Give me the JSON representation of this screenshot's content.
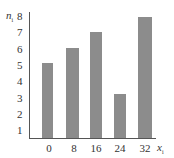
{
  "chart_data": {
    "type": "bar",
    "title": "",
    "xlabel": "x_i",
    "ylabel": "n_i",
    "xlabel_main": "x",
    "xlabel_sub": "i",
    "ylabel_main": "n",
    "ylabel_sub": "i",
    "categories": [
      "0",
      "8",
      "16",
      "24",
      "32"
    ],
    "values": [
      5.2,
      6.1,
      7.1,
      3.3,
      8.0
    ],
    "yticks": [
      "1",
      "2",
      "3",
      "4",
      "5",
      "6",
      "7",
      "8"
    ],
    "ylim": [
      0,
      8
    ],
    "grid": false,
    "legend": null,
    "bar_color": "#8c8c8c",
    "axis_color": "#555555"
  }
}
